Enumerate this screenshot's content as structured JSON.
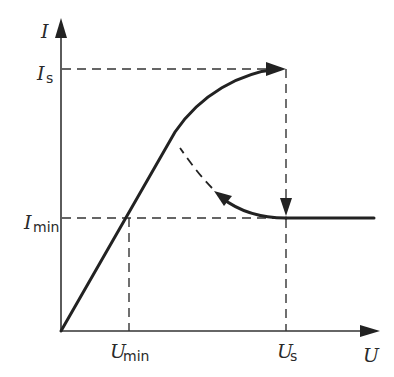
{
  "diagram": {
    "type": "current-voltage characteristic (I-U curve) with hysteresis",
    "axes": {
      "x_label": "U",
      "y_label": "I"
    },
    "markers": {
      "y": [
        {
          "symbol": "I",
          "subscript": "s"
        },
        {
          "symbol": "I",
          "subscript": "min"
        }
      ],
      "x": [
        {
          "symbol": "U",
          "subscript": "min"
        },
        {
          "symbol": "U",
          "subscript": "s"
        }
      ]
    },
    "curves": [
      {
        "name": "rising-branch",
        "style": "solid",
        "description": "linear rise from origin through (U_min, I_min), then concave curve up to (U_s, I_s) with arrow"
      },
      {
        "name": "drop-branch",
        "style": "solid",
        "description": "vertical drop at U_s from I_s to I_min with downward arrow"
      },
      {
        "name": "return-branch",
        "style": "solid+dashed",
        "description": "curve from (U_s, I_min) back toward the rising branch with arrow, continuing dashed"
      },
      {
        "name": "saturation-branch",
        "style": "solid",
        "description": "horizontal line at I_min for U > U_s"
      }
    ],
    "colors": {
      "line": "#222222",
      "background": "#ffffff"
    }
  }
}
